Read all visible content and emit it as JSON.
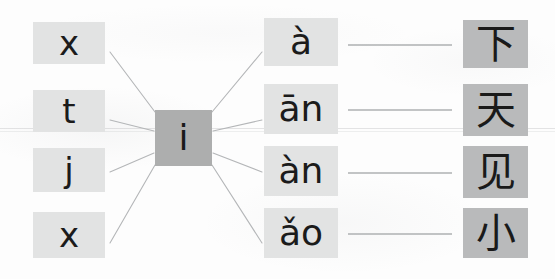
{
  "worksheet": {
    "type": "pinyin-matching-exercise",
    "background_color": "#fdfdfd",
    "colors": {
      "left_tile": "#e2e3e3",
      "center_tile": "#adaeae",
      "pinyin_tile": "#e2e3e3",
      "hanzi_tile": "#b9babb",
      "text": "#1b1b1b",
      "line": "#b4b6b8"
    },
    "initials": {
      "label": "initial-consonant-column",
      "items": [
        {
          "text": "x",
          "row": 1
        },
        {
          "text": "t",
          "row": 2
        },
        {
          "text": "j",
          "row": 3
        },
        {
          "text": "x",
          "row": 4
        }
      ]
    },
    "center": {
      "label": "shared-vowel-tile",
      "text": "i"
    },
    "finals": {
      "label": "pinyin-final-column",
      "items": [
        {
          "text": "à",
          "row": 1
        },
        {
          "text": "ān",
          "row": 2
        },
        {
          "text": "àn",
          "row": 3
        },
        {
          "text": "ǎo",
          "row": 4
        }
      ]
    },
    "hanzi": {
      "label": "chinese-character-column",
      "items": [
        {
          "text": "下",
          "row": 1
        },
        {
          "text": "天",
          "row": 2
        },
        {
          "text": "见",
          "row": 3
        },
        {
          "text": "小",
          "row": 4
        }
      ]
    },
    "connector_lines": {
      "radiating_count": 8,
      "horizontal_count": 4
    }
  }
}
